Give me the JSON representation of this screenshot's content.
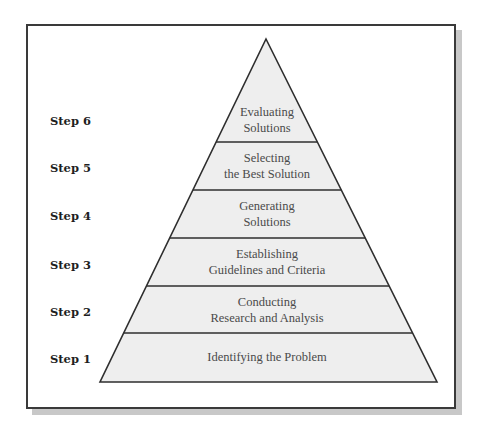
{
  "diagram": {
    "type": "pyramid",
    "colors": {
      "tier_fill": "#eeeeee",
      "outline": "#2e2e2e",
      "frame_border": "#3a3a3a",
      "frame_shadow": "#c8c8c8",
      "step_label": "#1e1e1e",
      "tier_text": "#4a4a4a"
    },
    "steps": [
      {
        "step": "Step 6",
        "lines": [
          "Evaluating",
          "Solutions"
        ]
      },
      {
        "step": "Step 5",
        "lines": [
          "Selecting",
          "the Best Solution"
        ]
      },
      {
        "step": "Step 4",
        "lines": [
          "Generating",
          "Solutions"
        ]
      },
      {
        "step": "Step 3",
        "lines": [
          "Establishing",
          "Guidelines and Criteria"
        ]
      },
      {
        "step": "Step 2",
        "lines": [
          "Conducting",
          "Research and Analysis"
        ]
      },
      {
        "step": "Step 1",
        "lines": [
          "Identifying the Problem"
        ]
      }
    ]
  }
}
